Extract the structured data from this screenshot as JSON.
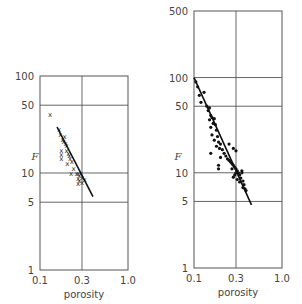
{
  "chart_data": [
    {
      "type": "scatter",
      "title": "",
      "xlabel": "porosity",
      "ylabel": "F",
      "xscale": "log",
      "yscale": "log",
      "xlim": [
        0.1,
        1.0
      ],
      "ylim": [
        1,
        100
      ],
      "x_ticks": [
        "0.1",
        "0.3",
        "1.0"
      ],
      "y_ticks": [
        "1",
        "5",
        "10",
        "50",
        "100"
      ],
      "grid": true,
      "marker": "x",
      "series": [
        {
          "name": "samples",
          "points": [
            [
              0.13,
              40
            ],
            [
              0.165,
              28
            ],
            [
              0.17,
              25
            ],
            [
              0.18,
              22
            ],
            [
              0.185,
              21
            ],
            [
              0.19,
              24
            ],
            [
              0.195,
              20
            ],
            [
              0.2,
              19
            ],
            [
              0.175,
              17
            ],
            [
              0.175,
              15.5
            ],
            [
              0.175,
              14
            ],
            [
              0.2,
              17
            ],
            [
              0.21,
              16
            ],
            [
              0.215,
              15
            ],
            [
              0.22,
              14
            ],
            [
              0.23,
              13
            ],
            [
              0.205,
              12.5
            ],
            [
              0.24,
              11
            ],
            [
              0.225,
              10
            ],
            [
              0.26,
              10
            ],
            [
              0.27,
              9.8
            ],
            [
              0.28,
              9.5
            ],
            [
              0.29,
              10
            ],
            [
              0.3,
              9
            ],
            [
              0.27,
              8.8
            ],
            [
              0.28,
              8.3
            ],
            [
              0.3,
              8
            ],
            [
              0.32,
              8.5
            ],
            [
              0.27,
              7.8
            ]
          ]
        },
        {
          "name": "fit",
          "type": "line",
          "points": [
            [
              0.156,
              29.8
            ],
            [
              0.4,
              5.7
            ]
          ]
        }
      ]
    },
    {
      "type": "scatter",
      "title": "",
      "xlabel": "porosity",
      "ylabel": "F",
      "xscale": "log",
      "yscale": "log",
      "xlim": [
        0.1,
        1.0
      ],
      "ylim": [
        1,
        500
      ],
      "x_ticks": [
        "0.1",
        "0.3",
        "1.0"
      ],
      "y_ticks": [
        "1",
        "5",
        "10",
        "50",
        "100",
        "500"
      ],
      "grid": true,
      "marker": "dot",
      "series": [
        {
          "name": "samples",
          "points": [
            [
              0.105,
              90
            ],
            [
              0.11,
              80
            ],
            [
              0.115,
              65
            ],
            [
              0.13,
              70
            ],
            [
              0.12,
              55
            ],
            [
              0.14,
              50
            ],
            [
              0.145,
              45
            ],
            [
              0.15,
              48
            ],
            [
              0.155,
              40
            ],
            [
              0.16,
              38
            ],
            [
              0.15,
              36
            ],
            [
              0.17,
              37
            ],
            [
              0.165,
              33
            ],
            [
              0.155,
              30
            ],
            [
              0.175,
              32
            ],
            [
              0.18,
              28
            ],
            [
              0.16,
              25
            ],
            [
              0.17,
              22
            ],
            [
              0.185,
              24
            ],
            [
              0.19,
              21
            ],
            [
              0.2,
              20
            ],
            [
              0.18,
              19
            ],
            [
              0.195,
              18
            ],
            [
              0.21,
              17.5
            ],
            [
              0.155,
              16
            ],
            [
              0.22,
              16
            ],
            [
              0.23,
              15
            ],
            [
              0.24,
              14
            ],
            [
              0.2,
              14.5
            ],
            [
              0.25,
              13.5
            ],
            [
              0.26,
              13
            ],
            [
              0.27,
              12.5
            ],
            [
              0.19,
              12
            ],
            [
              0.28,
              12
            ],
            [
              0.29,
              11.5
            ],
            [
              0.27,
              11
            ],
            [
              0.3,
              11
            ],
            [
              0.31,
              10.5
            ],
            [
              0.19,
              11
            ],
            [
              0.3,
              10
            ],
            [
              0.29,
              9.5
            ],
            [
              0.32,
              10
            ],
            [
              0.33,
              9.5
            ],
            [
              0.35,
              10.5
            ],
            [
              0.35,
              10
            ],
            [
              0.28,
              9
            ],
            [
              0.31,
              8.5
            ],
            [
              0.34,
              8.8
            ],
            [
              0.33,
              8
            ],
            [
              0.36,
              8.2
            ],
            [
              0.37,
              7.5
            ],
            [
              0.36,
              7
            ],
            [
              0.38,
              6.8
            ],
            [
              0.39,
              6.5
            ],
            [
              0.3,
              17
            ],
            [
              0.25,
              20
            ],
            [
              0.28,
              18
            ]
          ]
        },
        {
          "name": "fit",
          "type": "line",
          "points": [
            [
              0.1,
              100
            ],
            [
              0.45,
              4.6
            ]
          ]
        }
      ]
    }
  ]
}
